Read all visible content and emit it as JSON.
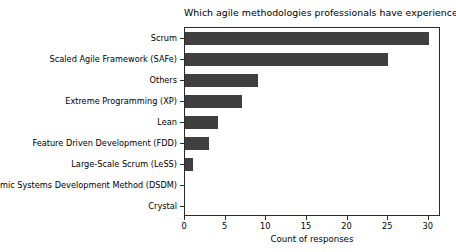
{
  "chart_data": {
    "type": "bar",
    "orientation": "horizontal",
    "title": "Which agile methodologies professionals have experience with",
    "xlabel": "Count of responses",
    "ylabel": "",
    "categories": [
      "Scrum",
      "Scaled Agile Framework (SAFe)",
      "Others",
      "Extreme Programming (XP)",
      "Lean",
      "Feature Driven Development (FDD)",
      "Large-Scale Scrum (LeSS)",
      "Dynamic Systems Development Method (DSDM)",
      "Crystal"
    ],
    "values": [
      30,
      25,
      9,
      7,
      4,
      3,
      1,
      0,
      0
    ],
    "xlim": [
      0,
      31.5
    ],
    "xticks": [
      0,
      5,
      10,
      15,
      20,
      25,
      30
    ],
    "xtick_labels": [
      "0",
      "5",
      "10",
      "15",
      "20",
      "25",
      "30"
    ],
    "grid": false,
    "legend": null,
    "bar_color": "#3f3f3f",
    "axes_color": "#2b2b2b",
    "background_color": "#ffffff"
  }
}
